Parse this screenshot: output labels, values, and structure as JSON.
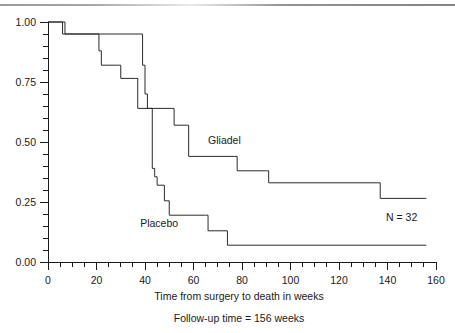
{
  "chart_data": {
    "type": "line",
    "subtype": "kaplan-meier-step",
    "title": "",
    "xlabel": "Time from surgery to death in weeks",
    "ylabel": "",
    "caption": "Follow-up time = 156 weeks",
    "annotation": "N = 32",
    "xlim": [
      0,
      160
    ],
    "ylim": [
      0,
      1.0
    ],
    "grid": false,
    "legend_position": "inline-on-curve",
    "x_ticks_major": [
      0,
      20,
      40,
      60,
      80,
      100,
      120,
      140,
      160
    ],
    "x_tick_labels": [
      "0",
      "20",
      "40",
      "60",
      "80",
      "100",
      "120",
      "140",
      "160"
    ],
    "x_tick_minor_step": 5,
    "y_ticks_major": [
      0.0,
      0.25,
      0.5,
      0.75,
      1.0
    ],
    "y_tick_labels": [
      "0.00",
      "0.25",
      "0.50",
      "0.75",
      "1.00"
    ],
    "y_tick_minor_step": 0.05,
    "series": [
      {
        "name": "Gliadel",
        "label": "Gliadel",
        "label_x": 66,
        "label_y": 0.49,
        "steps": [
          {
            "x": 0,
            "y": 1.0
          },
          {
            "x": 6,
            "y": 1.0
          },
          {
            "x": 7,
            "y": 0.95
          },
          {
            "x": 38,
            "y": 0.95
          },
          {
            "x": 39,
            "y": 0.82
          },
          {
            "x": 40,
            "y": 0.7
          },
          {
            "x": 41,
            "y": 0.64
          },
          {
            "x": 51,
            "y": 0.64
          },
          {
            "x": 52,
            "y": 0.57
          },
          {
            "x": 57,
            "y": 0.57
          },
          {
            "x": 58,
            "y": 0.44
          },
          {
            "x": 77,
            "y": 0.44
          },
          {
            "x": 78,
            "y": 0.38
          },
          {
            "x": 90,
            "y": 0.38
          },
          {
            "x": 91,
            "y": 0.33
          },
          {
            "x": 136,
            "y": 0.33
          },
          {
            "x": 137,
            "y": 0.265
          },
          {
            "x": 156,
            "y": 0.265
          }
        ]
      },
      {
        "name": "Placebo",
        "label": "Placebo",
        "label_x": 38,
        "label_y": 0.145,
        "steps": [
          {
            "x": 0,
            "y": 1.0
          },
          {
            "x": 5,
            "y": 1.0
          },
          {
            "x": 6,
            "y": 0.95
          },
          {
            "x": 20,
            "y": 0.95
          },
          {
            "x": 21,
            "y": 0.88
          },
          {
            "x": 22,
            "y": 0.82
          },
          {
            "x": 29,
            "y": 0.82
          },
          {
            "x": 30,
            "y": 0.765
          },
          {
            "x": 36,
            "y": 0.765
          },
          {
            "x": 37,
            "y": 0.64
          },
          {
            "x": 42,
            "y": 0.64
          },
          {
            "x": 43,
            "y": 0.39
          },
          {
            "x": 44,
            "y": 0.355
          },
          {
            "x": 45,
            "y": 0.32
          },
          {
            "x": 47,
            "y": 0.32
          },
          {
            "x": 48,
            "y": 0.255
          },
          {
            "x": 49,
            "y": 0.255
          },
          {
            "x": 50,
            "y": 0.195
          },
          {
            "x": 65,
            "y": 0.195
          },
          {
            "x": 66,
            "y": 0.13
          },
          {
            "x": 73,
            "y": 0.13
          },
          {
            "x": 74,
            "y": 0.07
          },
          {
            "x": 156,
            "y": 0.07
          }
        ]
      }
    ]
  },
  "figure": {
    "xlabel": "Time from surgery to death in weeks",
    "caption": "Follow-up time = 156 weeks",
    "annotation": "N = 32"
  },
  "colors": {
    "ink": "#1a1a1a",
    "curve": "#2b2b2b",
    "background": "#ffffff"
  }
}
